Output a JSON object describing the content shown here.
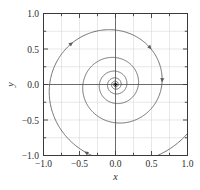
{
  "figure": {
    "background_color": "#ffffff",
    "frame_color": "#3a3a3a",
    "grid_color": "#d6d6d6",
    "axis_line_color": "#4a4a4a",
    "curve_color": "#5a5a5a"
  },
  "chart_data": {
    "type": "line",
    "title": "",
    "subtitle": "",
    "xlabel": "x",
    "ylabel": "y",
    "xlim": [
      -1.0,
      1.0
    ],
    "ylim": [
      -1.0,
      1.0
    ],
    "grid": true,
    "legend": null,
    "legend_position": "none",
    "x_ticks": [
      -1.0,
      -0.5,
      0.0,
      0.5,
      1.0
    ],
    "x_tick_labels": [
      "−1.0",
      "−0.5",
      "0.0",
      "0.5",
      "1.0"
    ],
    "y_ticks": [
      -1.0,
      -0.5,
      0.0,
      0.5,
      1.0
    ],
    "y_tick_labels": [
      "−1.0",
      "−0.5",
      "0.0",
      "0.5",
      "1.0"
    ],
    "minor_x_ticks": [
      -0.75,
      -0.25,
      0.25,
      0.75
    ],
    "minor_y_ticks": [
      -0.75,
      -0.25,
      0.25,
      0.75
    ],
    "gridlines_x": [
      -1.0,
      -0.75,
      -0.5,
      -0.25,
      0.0,
      0.25,
      0.5,
      0.75,
      1.0
    ],
    "gridlines_y": [
      -1.0,
      -0.75,
      -0.5,
      -0.25,
      0.0,
      0.25,
      0.5,
      0.75,
      1.0
    ],
    "series": [
      {
        "name": "spiral-trajectory",
        "kind": "parametric-spiral",
        "equation": "r(t) = r0 * exp(-k*t), theta(t) = theta0 - t",
        "r0": 1.42,
        "decay_k": 0.112,
        "theta0_deg": 45,
        "turns": 9.5,
        "direction": "clockwise-inward",
        "fixed_point": [
          0.0,
          0.0
        ],
        "fixed_point_type": "stable focus",
        "arrow_positions": [
          [
            -0.78,
            0.83
          ],
          [
            0.7,
            0.66
          ],
          [
            -0.43,
            -0.93
          ],
          [
            0.5,
            0.04
          ]
        ]
      }
    ]
  },
  "axes": {
    "x_axis_label": "x",
    "y_axis_label": "y"
  }
}
